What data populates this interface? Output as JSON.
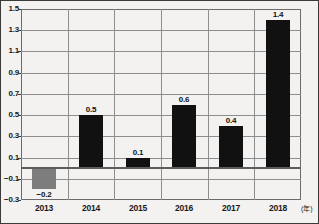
{
  "chart_data": {
    "type": "bar",
    "title": "",
    "subtitle": "",
    "xlabel": "",
    "ylabel": "",
    "x_unit_label": "(年)",
    "categories": [
      "2013",
      "2014",
      "2015",
      "2016",
      "2017",
      "2018"
    ],
    "values": [
      -0.2,
      0.5,
      0.1,
      0.6,
      0.4,
      1.4
    ],
    "value_labels": [
      "−0.2",
      "0.5",
      "0.1",
      "0.6",
      "0.4",
      "1.4"
    ],
    "bar_colors": [
      "#7d7d7d",
      "#111111",
      "#111111",
      "#111111",
      "#111111",
      "#111111"
    ],
    "ylim": [
      -0.3,
      1.5
    ],
    "ytick_step": 0.2,
    "yticks": [
      1.5,
      1.3,
      1.1,
      0.9,
      0.7,
      0.5,
      0.3,
      0.1,
      -0.1,
      -0.3
    ],
    "ytick_labels": [
      "1.5",
      "1.3",
      "1.1",
      "0.9",
      "0.7",
      "0.5",
      "0.3",
      "0.1",
      "−0.1",
      "−0.3"
    ],
    "grid": true,
    "grid_axis": "both",
    "zero_line": true,
    "legend": false,
    "legend_position": "none",
    "background_color": "#f3f2f0",
    "grid_color": "#8e8e8e",
    "axis_color": "#6b6b6b",
    "text_color": "#1a1a1a"
  }
}
